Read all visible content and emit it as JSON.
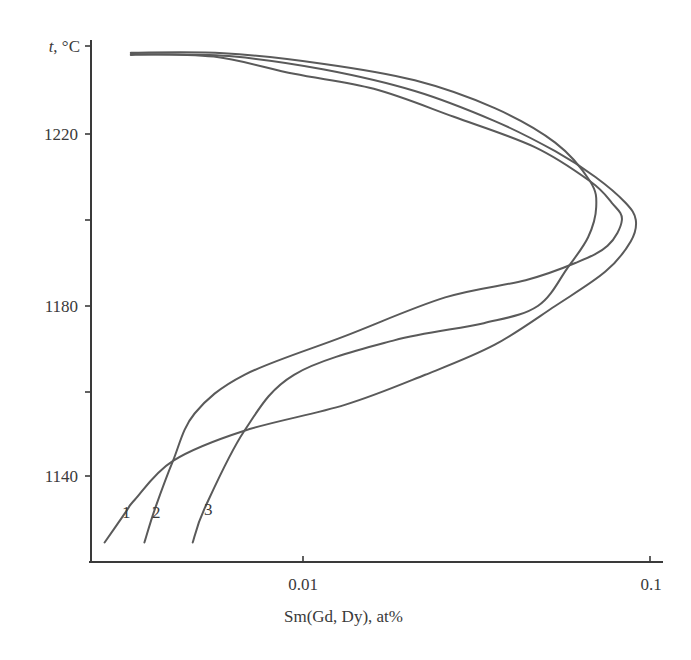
{
  "chart_data": {
    "type": "line",
    "title": "",
    "xlabel": "Sm(Gd, Dy), at%",
    "ylabel": "t, °C",
    "ylabel_italic_part": "t",
    "ylabel_rest": ", °C",
    "xscale": "log",
    "xlim": [
      0.00243,
      0.109
    ],
    "ylim": [
      1120.5,
      1240.5
    ],
    "grid": false,
    "legend": "inline numeric labels near curve bottoms",
    "x_ticks": [
      {
        "value": 0.01,
        "label": "0.01"
      },
      {
        "value": 0.1,
        "label": "0.1"
      }
    ],
    "y_ticks": [
      {
        "value": 1240,
        "label": ""
      },
      {
        "value": 1220,
        "label": "1220"
      },
      {
        "value": 1200,
        "label": ""
      },
      {
        "value": 1180,
        "label": "1180"
      },
      {
        "value": 1160,
        "label": ""
      },
      {
        "value": 1140,
        "label": "1140"
      }
    ],
    "series": [
      {
        "name": "1",
        "label_pos": {
          "x": 0.00304,
          "t": 1130
        },
        "points": [
          {
            "x": 0.00268,
            "t": 1125
          },
          {
            "x": 0.00308,
            "t": 1132
          },
          {
            "x": 0.00328,
            "t": 1135
          },
          {
            "x": 0.00422,
            "t": 1144
          },
          {
            "x": 0.00678,
            "t": 1151
          },
          {
            "x": 0.0132,
            "t": 1157
          },
          {
            "x": 0.0225,
            "t": 1164
          },
          {
            "x": 0.0357,
            "t": 1171
          },
          {
            "x": 0.0533,
            "t": 1180
          },
          {
            "x": 0.0744,
            "t": 1188
          },
          {
            "x": 0.088,
            "t": 1195
          },
          {
            "x": 0.091,
            "t": 1200
          },
          {
            "x": 0.085,
            "t": 1204
          },
          {
            "x": 0.0696,
            "t": 1210
          },
          {
            "x": 0.0533,
            "t": 1216
          },
          {
            "x": 0.0357,
            "t": 1223
          },
          {
            "x": 0.021,
            "t": 1230
          },
          {
            "x": 0.0115,
            "t": 1235
          },
          {
            "x": 0.00634,
            "t": 1238
          },
          {
            "x": 0.00398,
            "t": 1238.5
          },
          {
            "x": 0.00319,
            "t": 1238.4
          }
        ]
      },
      {
        "name": "2",
        "label_pos": {
          "x": 0.0039,
          "t": 1130
        },
        "points": [
          {
            "x": 0.00349,
            "t": 1125
          },
          {
            "x": 0.00375,
            "t": 1133
          },
          {
            "x": 0.00422,
            "t": 1144
          },
          {
            "x": 0.00487,
            "t": 1155
          },
          {
            "x": 0.00678,
            "t": 1164
          },
          {
            "x": 0.0132,
            "t": 1173
          },
          {
            "x": 0.0257,
            "t": 1182
          },
          {
            "x": 0.0438,
            "t": 1186
          },
          {
            "x": 0.0609,
            "t": 1190
          },
          {
            "x": 0.0755,
            "t": 1194
          },
          {
            "x": 0.083,
            "t": 1200
          },
          {
            "x": 0.0776,
            "t": 1204
          },
          {
            "x": 0.0672,
            "t": 1209
          },
          {
            "x": 0.0464,
            "t": 1217
          },
          {
            "x": 0.0272,
            "t": 1224
          },
          {
            "x": 0.016,
            "t": 1230.5
          },
          {
            "x": 0.00942,
            "t": 1234
          },
          {
            "x": 0.00553,
            "t": 1238
          },
          {
            "x": 0.00319,
            "t": 1238.6
          }
        ]
      },
      {
        "name": "3",
        "label_pos": {
          "x": 0.0053,
          "t": 1130
        },
        "points": [
          {
            "x": 0.00481,
            "t": 1125
          },
          {
            "x": 0.00521,
            "t": 1133
          },
          {
            "x": 0.00678,
            "t": 1151
          },
          {
            "x": 0.00942,
            "t": 1164
          },
          {
            "x": 0.0183,
            "t": 1172
          },
          {
            "x": 0.0332,
            "t": 1176
          },
          {
            "x": 0.0475,
            "t": 1180
          },
          {
            "x": 0.058,
            "t": 1189
          },
          {
            "x": 0.0663,
            "t": 1196
          },
          {
            "x": 0.07,
            "t": 1203
          },
          {
            "x": 0.0672,
            "t": 1209
          },
          {
            "x": 0.0533,
            "t": 1218
          },
          {
            "x": 0.0357,
            "t": 1226
          },
          {
            "x": 0.021,
            "t": 1232.5
          },
          {
            "x": 0.0115,
            "t": 1236.3
          },
          {
            "x": 0.00591,
            "t": 1238.8
          },
          {
            "x": 0.00319,
            "t": 1238.9
          }
        ]
      }
    ]
  },
  "plot": {
    "ylabel_t": "t",
    "ylabel_unit": ", °C",
    "xlabel": "Sm(Gd, Dy), at%",
    "x_tick_labels": [
      "0.01",
      "0.1"
    ],
    "y_tick_labels": [
      "1220",
      "1180",
      "1140"
    ],
    "curve_labels": [
      "1",
      "2",
      "3"
    ],
    "line_color": "#5a5a5a",
    "axis_color": "#3a3a3a"
  }
}
